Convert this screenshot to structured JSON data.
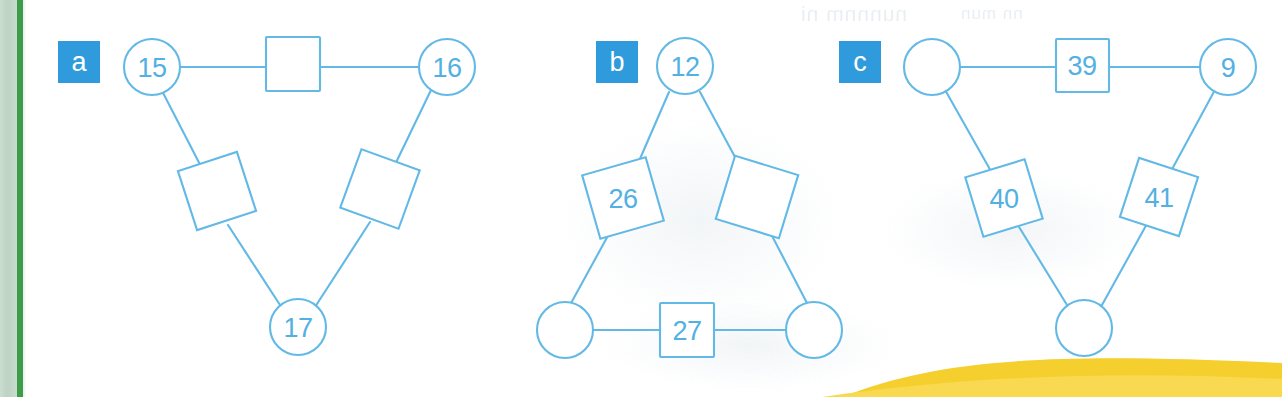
{
  "figure": {
    "type": "diagram",
    "accent_blue": "#52b0e2",
    "badge_blue": "#2f9bdd",
    "stroke_blue": "#63b9e6",
    "margin_green": "#3d9c4a",
    "swoosh_yellow": "#f5cf2e",
    "page_background": "#ffffff"
  },
  "panels": [
    {
      "id": "panel-a",
      "badge": "a",
      "nodes": [
        {
          "name": "top-left-circle",
          "shape": "circle",
          "label": "15"
        },
        {
          "name": "top-middle-square",
          "shape": "square",
          "label": ""
        },
        {
          "name": "top-right-circle",
          "shape": "circle",
          "label": "16"
        },
        {
          "name": "left-diamond",
          "shape": "diamond",
          "label": ""
        },
        {
          "name": "right-diamond",
          "shape": "diamond",
          "label": ""
        },
        {
          "name": "bottom-circle",
          "shape": "circle",
          "label": "17"
        }
      ],
      "edges": [
        "top-left-circle - top-middle-square",
        "top-middle-square - top-right-circle",
        "top-left-circle - left-diamond",
        "left-diamond - bottom-circle",
        "top-right-circle - right-diamond",
        "right-diamond - bottom-circle"
      ]
    },
    {
      "id": "panel-b",
      "badge": "b",
      "nodes": [
        {
          "name": "top-circle",
          "shape": "circle",
          "label": "12"
        },
        {
          "name": "left-diamond",
          "shape": "diamond",
          "label": "26"
        },
        {
          "name": "right-diamond",
          "shape": "diamond",
          "label": ""
        },
        {
          "name": "bottom-left-circle",
          "shape": "circle",
          "label": ""
        },
        {
          "name": "bottom-middle-square",
          "shape": "square",
          "label": "27"
        },
        {
          "name": "bottom-right-circle",
          "shape": "circle",
          "label": ""
        }
      ],
      "edges": [
        "top-circle - left-diamond",
        "left-diamond - bottom-left-circle",
        "top-circle - right-diamond",
        "right-diamond - bottom-right-circle",
        "bottom-left-circle - bottom-middle-square",
        "bottom-middle-square - bottom-right-circle"
      ]
    },
    {
      "id": "panel-c",
      "badge": "c",
      "nodes": [
        {
          "name": "top-left-circle",
          "shape": "circle",
          "label": ""
        },
        {
          "name": "top-middle-square",
          "shape": "square",
          "label": "39"
        },
        {
          "name": "top-right-circle",
          "shape": "circle",
          "label": "9"
        },
        {
          "name": "left-diamond",
          "shape": "diamond",
          "label": "40"
        },
        {
          "name": "right-diamond",
          "shape": "diamond",
          "label": "41"
        },
        {
          "name": "bottom-circle",
          "shape": "circle",
          "label": ""
        }
      ],
      "edges": [
        "top-left-circle - top-middle-square",
        "top-middle-square - top-right-circle",
        "top-left-circle - left-diamond",
        "left-diamond - bottom-circle",
        "top-right-circle - right-diamond",
        "right-diamond - bottom-circle"
      ]
    }
  ]
}
